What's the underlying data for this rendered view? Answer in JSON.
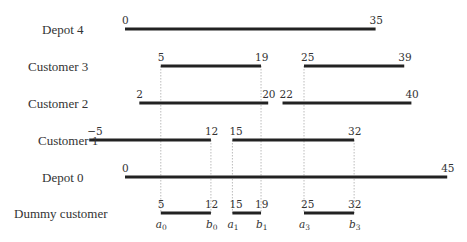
{
  "chart_data": {
    "type": "gantt-intervals",
    "title": "",
    "axis": {
      "scale_px_per_unit": 7.16,
      "origin_px": 125
    },
    "rows": [
      {
        "label": "Depot 4",
        "y": 29,
        "intervals": [
          [
            0,
            35
          ]
        ]
      },
      {
        "label": "Customer 3",
        "y": 66,
        "intervals": [
          [
            5,
            19
          ],
          [
            25,
            39
          ]
        ]
      },
      {
        "label": "Customer 2",
        "y": 103,
        "intervals": [
          [
            2,
            20
          ],
          [
            22,
            40
          ]
        ]
      },
      {
        "label": "Customer 1",
        "y": 140,
        "intervals": [
          [
            -5,
            12
          ],
          [
            15,
            32
          ]
        ]
      },
      {
        "label": "Depot 0",
        "y": 177,
        "intervals": [
          [
            0,
            45
          ]
        ]
      },
      {
        "label": "Dummy customer",
        "y": 213,
        "intervals": [
          [
            5,
            12
          ],
          [
            15,
            19
          ],
          [
            25,
            32
          ]
        ]
      }
    ],
    "guides": [
      {
        "x": 5,
        "from_row": 1
      },
      {
        "x": 19,
        "from_row": 1
      },
      {
        "x": 25,
        "from_row": 1
      },
      {
        "x": 12,
        "from_row": 3
      },
      {
        "x": 15,
        "from_row": 3
      },
      {
        "x": 32,
        "from_row": 3
      }
    ],
    "dummy_labels": [
      {
        "x": 5,
        "letter": "a",
        "idx": "0"
      },
      {
        "x": 12,
        "letter": "b",
        "idx": "0"
      },
      {
        "x": 15,
        "letter": "a",
        "idx": "1"
      },
      {
        "x": 19,
        "letter": "b",
        "idx": "1"
      },
      {
        "x": 25,
        "letter": "a",
        "idx": "3"
      },
      {
        "x": 32,
        "letter": "b",
        "idx": "3"
      }
    ]
  }
}
